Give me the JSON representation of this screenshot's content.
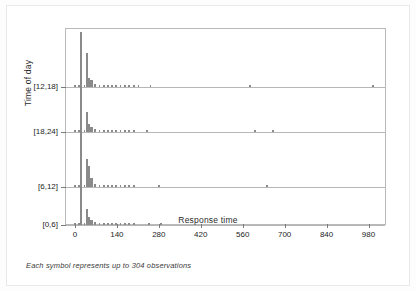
{
  "figure": {
    "footnote": "Each symbol represents up to 304 observations"
  },
  "chart_data": {
    "type": "scatter",
    "title": "",
    "subtitle": "",
    "xlabel": "Response time",
    "ylabel": "Time of day",
    "xlim": [
      -30,
      1035
    ],
    "xticks": [
      0,
      140,
      280,
      420,
      560,
      700,
      840,
      980
    ],
    "xticklabels": [
      "0",
      "140",
      "280",
      "420",
      "560",
      "700",
      "840",
      "980"
    ],
    "yticklabels": [
      "[12,18]",
      "[18,24]",
      "[6,12]",
      "[0,6]"
    ],
    "ycategories": [
      "[12,18]",
      "[18,24]",
      "[6,12]",
      "[0,6]"
    ],
    "grid": false,
    "legend": null,
    "note": "Stacked dot-density plot; each band is a baseline for one time-of-day group. Stack heights are counts in units of symbols (1 symbol = up to 304 observations).",
    "symbol_unit_observations": 304,
    "series": [
      {
        "name": "[12,18]",
        "baseline_index": 0,
        "points": [
          {
            "x": 0,
            "stack": 1
          },
          {
            "x": 14,
            "stack": 1
          },
          {
            "x": 20,
            "stack": 55
          },
          {
            "x": 32,
            "stack": 1
          },
          {
            "x": 40,
            "stack": 34
          },
          {
            "x": 48,
            "stack": 9
          },
          {
            "x": 55,
            "stack": 7
          },
          {
            "x": 68,
            "stack": 3
          },
          {
            "x": 82,
            "stack": 2
          },
          {
            "x": 96,
            "stack": 2
          },
          {
            "x": 110,
            "stack": 2
          },
          {
            "x": 124,
            "stack": 2
          },
          {
            "x": 138,
            "stack": 2
          },
          {
            "x": 152,
            "stack": 2
          },
          {
            "x": 166,
            "stack": 2
          },
          {
            "x": 180,
            "stack": 2
          },
          {
            "x": 196,
            "stack": 2
          },
          {
            "x": 212,
            "stack": 1
          },
          {
            "x": 252,
            "stack": 1
          },
          {
            "x": 585,
            "stack": 1
          },
          {
            "x": 995,
            "stack": 1
          }
        ]
      },
      {
        "name": "[18,24]",
        "baseline_index": 1,
        "points": [
          {
            "x": 0,
            "stack": 1
          },
          {
            "x": 14,
            "stack": 1
          },
          {
            "x": 20,
            "stack": 46
          },
          {
            "x": 32,
            "stack": 1
          },
          {
            "x": 40,
            "stack": 20
          },
          {
            "x": 48,
            "stack": 8
          },
          {
            "x": 55,
            "stack": 5
          },
          {
            "x": 68,
            "stack": 3
          },
          {
            "x": 82,
            "stack": 2
          },
          {
            "x": 96,
            "stack": 2
          },
          {
            "x": 110,
            "stack": 2
          },
          {
            "x": 124,
            "stack": 2
          },
          {
            "x": 138,
            "stack": 2
          },
          {
            "x": 152,
            "stack": 2
          },
          {
            "x": 166,
            "stack": 2
          },
          {
            "x": 180,
            "stack": 2
          },
          {
            "x": 196,
            "stack": 2
          },
          {
            "x": 240,
            "stack": 1
          },
          {
            "x": 600,
            "stack": 1
          },
          {
            "x": 660,
            "stack": 1
          }
        ]
      },
      {
        "name": "[6,12]",
        "baseline_index": 2,
        "points": [
          {
            "x": 0,
            "stack": 1
          },
          {
            "x": 14,
            "stack": 1
          },
          {
            "x": 20,
            "stack": 66
          },
          {
            "x": 32,
            "stack": 1
          },
          {
            "x": 40,
            "stack": 28
          },
          {
            "x": 48,
            "stack": 21
          },
          {
            "x": 55,
            "stack": 9
          },
          {
            "x": 68,
            "stack": 3
          },
          {
            "x": 82,
            "stack": 2
          },
          {
            "x": 96,
            "stack": 2
          },
          {
            "x": 110,
            "stack": 2
          },
          {
            "x": 124,
            "stack": 2
          },
          {
            "x": 138,
            "stack": 2
          },
          {
            "x": 152,
            "stack": 2
          },
          {
            "x": 166,
            "stack": 2
          },
          {
            "x": 180,
            "stack": 2
          },
          {
            "x": 196,
            "stack": 2
          },
          {
            "x": 280,
            "stack": 1
          },
          {
            "x": 640,
            "stack": 1
          }
        ]
      },
      {
        "name": "[0,6]",
        "baseline_index": 3,
        "points": [
          {
            "x": 0,
            "stack": 1
          },
          {
            "x": 14,
            "stack": 1
          },
          {
            "x": 20,
            "stack": 44
          },
          {
            "x": 32,
            "stack": 1
          },
          {
            "x": 40,
            "stack": 16
          },
          {
            "x": 48,
            "stack": 8
          },
          {
            "x": 55,
            "stack": 5
          },
          {
            "x": 68,
            "stack": 3
          },
          {
            "x": 82,
            "stack": 2
          },
          {
            "x": 96,
            "stack": 2
          },
          {
            "x": 110,
            "stack": 2
          },
          {
            "x": 124,
            "stack": 2
          },
          {
            "x": 138,
            "stack": 2
          },
          {
            "x": 152,
            "stack": 2
          },
          {
            "x": 166,
            "stack": 2
          },
          {
            "x": 180,
            "stack": 2
          },
          {
            "x": 196,
            "stack": 2
          },
          {
            "x": 248,
            "stack": 1
          },
          {
            "x": 286,
            "stack": 1
          }
        ]
      }
    ],
    "colors": {
      "mark": "#8a8a8a",
      "axis": "#b9b9b9",
      "band_line": "#b6b6b6",
      "text": "#1d1d1d"
    }
  }
}
